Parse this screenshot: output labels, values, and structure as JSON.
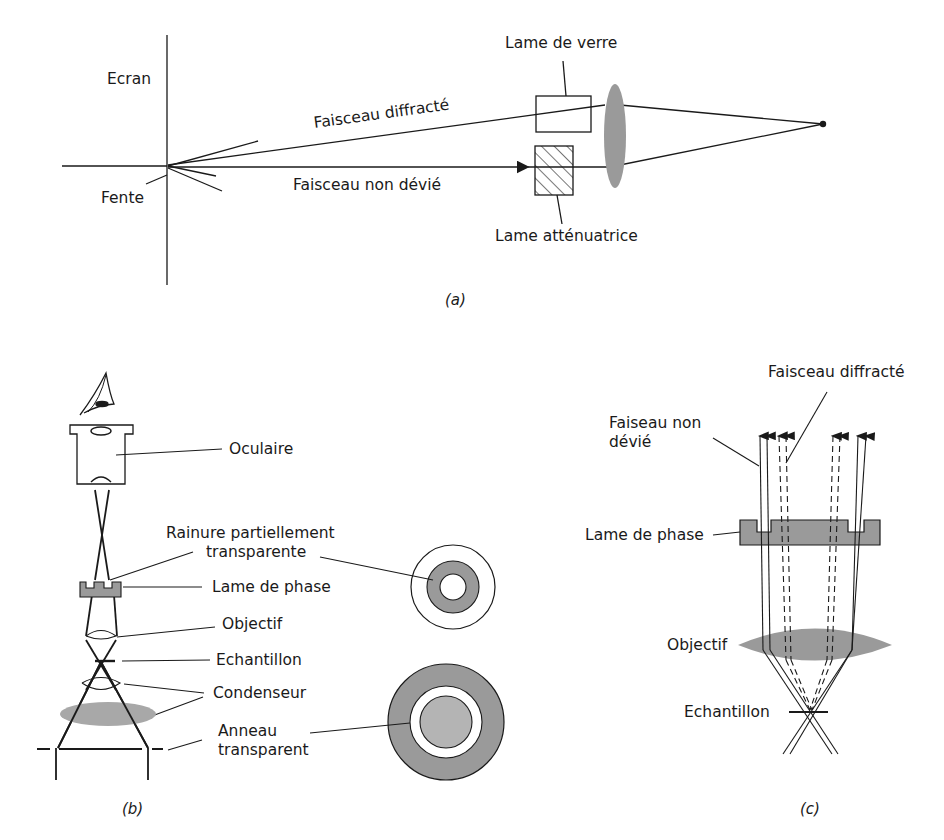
{
  "figure": {
    "panel_a": {
      "caption": "(a)",
      "labels": {
        "screen": "Ecran",
        "slit": "Fente",
        "diffracted_beam": "Faisceau diffracté",
        "undeviated_beam": "Faisceau non dévié",
        "glass_plate": "Lame de verre",
        "attenuating_plate": "Lame atténuatrice"
      }
    },
    "panel_b": {
      "caption": "(b)",
      "labels": {
        "eyepiece": "Oculaire",
        "groove_line1": "Rainure partiellement",
        "groove_line2": "transparente",
        "phase_plate": "Lame de phase",
        "objective": "Objectif",
        "sample": "Echantillon",
        "condenser": "Condenseur",
        "ring_line1": "Anneau",
        "ring_line2": "transparent"
      }
    },
    "panel_c": {
      "caption": "(c)",
      "labels": {
        "diffracted_beam": "Faisceau diffracté",
        "undeviated_line1": "Faiseau non",
        "undeviated_line2": "dévié",
        "phase_plate": "Lame de phase",
        "objective": "Objectif",
        "sample": "Echantillon"
      }
    },
    "colors": {
      "ink": "#1a1a1a",
      "gray_fill": "#9a9a9a",
      "light_gray_fill": "#b4b4b4",
      "background": "#ffffff"
    }
  }
}
